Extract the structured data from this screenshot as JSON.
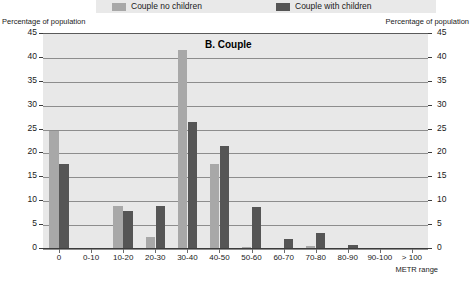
{
  "legend": {
    "entries": [
      {
        "label": "Couple no children",
        "color": "#a8a8a8",
        "swatch_name": "legend-swatch-light"
      },
      {
        "label": "Couple with children",
        "color": "#555555",
        "swatch_name": "legend-swatch-dark"
      }
    ]
  },
  "captions": {
    "left": "Percentage of population",
    "right": "Percentage of population"
  },
  "chart_data": {
    "type": "bar",
    "title": "B.  Couple",
    "xlabel": "METR range",
    "ylabel": "Percentage of population",
    "ylim": [
      0,
      45
    ],
    "yticks": [
      0,
      5,
      10,
      15,
      20,
      25,
      30,
      35,
      40,
      45
    ],
    "grid": true,
    "legend_position": "top",
    "categories": [
      "0",
      "0-10",
      "10-20",
      "20-30",
      "30-40",
      "40-50",
      "50-60",
      "60-70",
      "70-80",
      "80-90",
      "90-100",
      "> 100"
    ],
    "series": [
      {
        "name": "Couple no children",
        "color": "#a8a8a8",
        "values": [
          24.8,
          0,
          9.0,
          2.6,
          41.6,
          17.8,
          0.5,
          0,
          0.7,
          0,
          0,
          0
        ]
      },
      {
        "name": "Couple with children",
        "color": "#555555",
        "values": [
          17.8,
          0,
          8.0,
          9.0,
          26.6,
          21.6,
          8.8,
          2.0,
          3.3,
          0.8,
          0,
          0
        ]
      }
    ]
  }
}
